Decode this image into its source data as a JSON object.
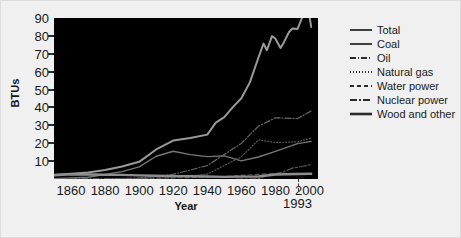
{
  "chart_data": {
    "type": "line",
    "title": "",
    "xlabel": "Year",
    "ylabel": "BTUs",
    "xlim": [
      1850,
      2005
    ],
    "ylim": [
      0,
      90
    ],
    "xticks": [
      1860,
      1880,
      1900,
      1920,
      1940,
      1960,
      1980,
      2000
    ],
    "yticks": [
      10,
      20,
      30,
      40,
      50,
      60,
      70,
      80,
      90
    ],
    "grid": false,
    "legend_position": "right",
    "annotations": [
      {
        "label": "1993",
        "x": 1993,
        "type": "vertical-dashed-tick"
      }
    ],
    "plot_background": "#000000",
    "figure_background": "#f0f0f0",
    "series": [
      {
        "name": "Total",
        "style": "solid",
        "color": "#9a9a9a",
        "width": 2.0,
        "x": [
          1850,
          1860,
          1870,
          1880,
          1890,
          1900,
          1910,
          1920,
          1930,
          1940,
          1945,
          1950,
          1955,
          1960,
          1965,
          1970,
          1973,
          1975,
          1978,
          1980,
          1983,
          1985,
          1988,
          1990,
          1993,
          1996,
          1999,
          2001
        ],
        "values": [
          2.4,
          3.0,
          3.6,
          5.0,
          7.0,
          9.6,
          16.5,
          21.5,
          22.9,
          24.8,
          31.5,
          34.6,
          40.2,
          45.1,
          54.0,
          67.8,
          75.7,
          72.0,
          79.9,
          78.4,
          73.2,
          76.5,
          82.2,
          84.1,
          83.9,
          91.0,
          96.8,
          85.0
        ]
      },
      {
        "name": "Coal",
        "style": "solid",
        "color": "#777777",
        "width": 1.4,
        "x": [
          1850,
          1870,
          1890,
          1900,
          1910,
          1920,
          1930,
          1940,
          1950,
          1960,
          1970,
          1980,
          1993,
          2001
        ],
        "values": [
          0.2,
          1.0,
          4.1,
          6.8,
          12.7,
          15.5,
          13.6,
          12.5,
          12.9,
          10.1,
          12.3,
          15.4,
          19.8,
          21.0
        ]
      },
      {
        "name": "Oil",
        "style": "dashdot",
        "color": "#6a6a6a",
        "width": 1.2,
        "x": [
          1860,
          1880,
          1900,
          1920,
          1940,
          1960,
          1970,
          1980,
          1993,
          2001
        ],
        "values": [
          0.0,
          0.1,
          0.5,
          2.6,
          7.5,
          19.9,
          29.5,
          34.2,
          33.8,
          38.0
        ]
      },
      {
        "name": "Natural gas",
        "style": "dotted",
        "color": "#5e5e5e",
        "width": 1.2,
        "x": [
          1880,
          1900,
          1920,
          1940,
          1960,
          1970,
          1980,
          1993,
          2001
        ],
        "values": [
          0.0,
          0.3,
          0.8,
          2.7,
          12.4,
          21.8,
          20.4,
          20.8,
          22.9
        ]
      },
      {
        "name": "Water power",
        "style": "dashed",
        "color": "#5a5a5a",
        "width": 1.2,
        "x": [
          1890,
          1910,
          1930,
          1950,
          1970,
          1980,
          1993,
          2001
        ],
        "values": [
          0.1,
          0.5,
          0.8,
          1.4,
          2.6,
          3.1,
          3.1,
          2.4
        ]
      },
      {
        "name": "Nuclear power",
        "style": "longdashdot",
        "color": "#565656",
        "width": 1.2,
        "x": [
          1957,
          1965,
          1970,
          1975,
          1980,
          1985,
          1990,
          1993,
          2001
        ],
        "values": [
          0.0,
          0.0,
          0.2,
          1.9,
          2.7,
          4.1,
          6.1,
          6.5,
          8.1
        ]
      },
      {
        "name": "Wood and other",
        "style": "solid-thick",
        "color": "#8e8e8e",
        "width": 2.4,
        "x": [
          1850,
          1860,
          1870,
          1880,
          1890,
          1900,
          1910,
          1920,
          1930,
          1940,
          1950,
          1960,
          1970,
          1980,
          1993,
          2001
        ],
        "values": [
          2.1,
          2.6,
          2.5,
          2.4,
          2.3,
          2.0,
          1.8,
          1.6,
          1.5,
          1.4,
          1.2,
          1.3,
          1.4,
          2.5,
          2.8,
          2.9
        ]
      }
    ]
  },
  "axes": {
    "ylabel": "BTUs",
    "xlabel": "Year",
    "ytick_labels": [
      "90",
      "80",
      "70",
      "60",
      "50",
      "40",
      "30",
      "20",
      "10"
    ],
    "xtick_labels": [
      "1860",
      "1880",
      "1900",
      "1920",
      "1940",
      "1960",
      "1980",
      "2000"
    ],
    "marker_label": "1993"
  },
  "legend": {
    "items": [
      {
        "label": "Total"
      },
      {
        "label": "Coal"
      },
      {
        "label": "Oil"
      },
      {
        "label": "Natural gas"
      },
      {
        "label": "Water power"
      },
      {
        "label": "Nuclear power"
      },
      {
        "label": "Wood and other"
      }
    ]
  }
}
